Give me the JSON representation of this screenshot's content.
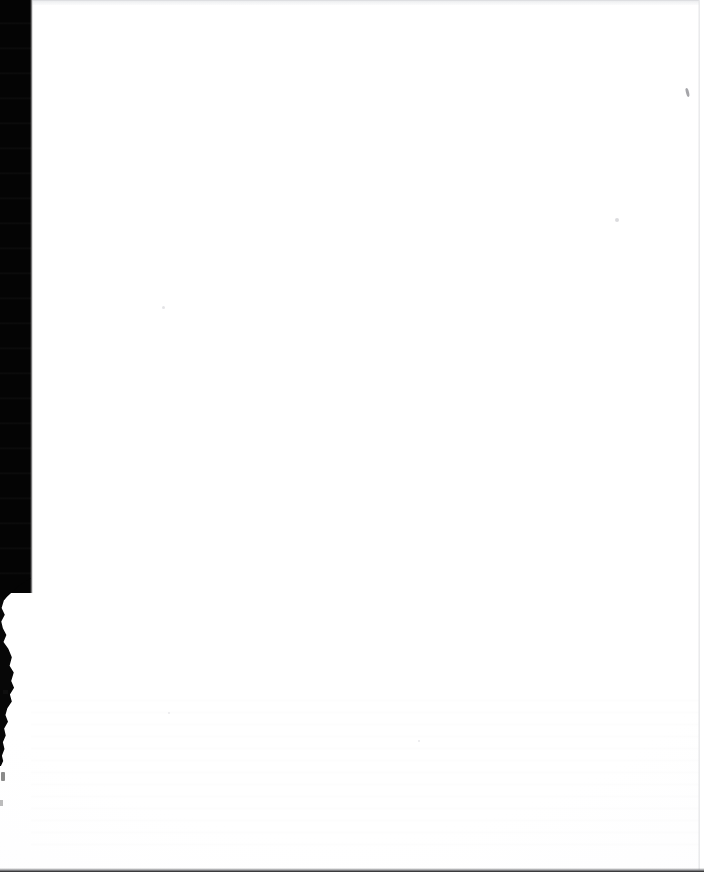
{
  "document": {
    "kind": "scanned-page",
    "page_title": "",
    "body_text": "",
    "visible_text": "",
    "note": ""
  },
  "canvas": {
    "width_px": 704,
    "height_px": 872,
    "paper_color": "#ffffff"
  },
  "artifacts": {
    "gutter": {
      "label": "",
      "color": "#040404",
      "edge_x_px": 31,
      "full_height_px": 593
    },
    "gutter_sliver": {
      "label": "",
      "color": "#070707",
      "top_px": 596,
      "height_px": 170
    },
    "top_scan_line": {
      "label": "",
      "color": "#e7e8ea"
    },
    "bottom_edge": {
      "label": "",
      "color": "#1b1b1c"
    },
    "right_edge": {
      "label": "",
      "color": "#e2e3e5"
    },
    "specks": [
      {
        "label": "",
        "color": "#6e6e74"
      },
      {
        "label": "",
        "color": "#cfcfd3"
      },
      {
        "label": "",
        "color": "#dcdce0"
      },
      {
        "label": "",
        "color": "#e3e3e6"
      },
      {
        "label": "",
        "color": "#e1e1e5"
      }
    ]
  }
}
